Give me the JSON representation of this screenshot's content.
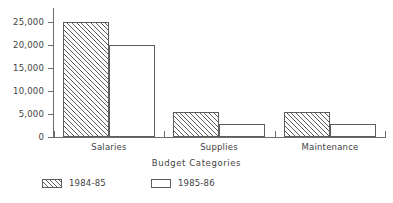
{
  "chart_data": {
    "type": "bar",
    "title": "",
    "xlabel": "Budget Categories",
    "ylabel": "",
    "categories": [
      "Salaries",
      "Supplies",
      "Maintenance"
    ],
    "series": [
      {
        "name": "1984-85",
        "values": [
          25000,
          5500,
          5500
        ],
        "style": "hatched"
      },
      {
        "name": "1985-86",
        "values": [
          20000,
          2800,
          2800
        ],
        "style": "open"
      }
    ],
    "ylim": [
      0,
      25000
    ],
    "yticks": [
      0,
      5000,
      10000,
      15000,
      20000,
      25000
    ],
    "ytick_labels": [
      "0",
      "5,000",
      "10,000",
      "15,000",
      "20,000",
      "25,000"
    ],
    "grid": false,
    "legend_position": "bottom-left",
    "colors": {
      "axis": "#6d6d6d",
      "bar_outline": "#5d5d5d",
      "hatch": "#5f5f5f",
      "bar_fill": "#ffffff",
      "text": "#3f3f3f",
      "background": "#ffffff"
    }
  },
  "legend": {
    "entries": [
      {
        "label": "1984-85",
        "swatch": "hatched-swatch-icon"
      },
      {
        "label": "1985-86",
        "swatch": "open-swatch-icon"
      }
    ]
  }
}
